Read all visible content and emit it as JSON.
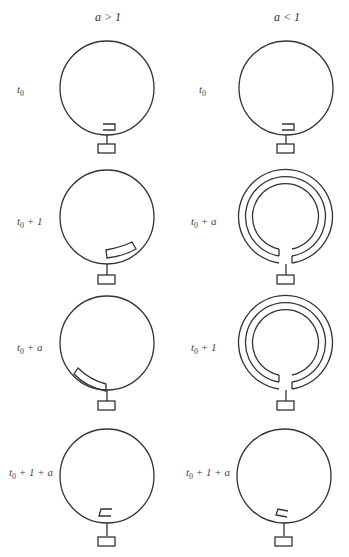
{
  "columns": [
    {
      "header": "a > 1"
    },
    {
      "header": "a < 1"
    }
  ],
  "rows": [
    {
      "left_label": "t0",
      "right_label": "t0"
    },
    {
      "left_label": "t0 + 1",
      "right_label": "t0 + a"
    },
    {
      "left_label": "t0 + a",
      "right_label": "t0 + 1"
    },
    {
      "left_label": "t0 + 1 + a",
      "right_label": "t0 + 1 + a"
    }
  ],
  "labels": {
    "r0l_sub": "0",
    "r0l_rest": "",
    "r1l_sub": "0",
    "r1l_rest": " + 1",
    "r2l_sub": "0",
    "r2l_rest": " + a",
    "r3l_sub": "0",
    "r3l_rest": " + 1 + a",
    "r0r_sub": "0",
    "r0r_rest": "",
    "r1r_sub": "0",
    "r1r_rest": " + a",
    "r2r_sub": "0",
    "r2r_rest": " + 1",
    "r3r_sub": "0",
    "r3r_rest": " + 1 + a",
    "t": "t"
  }
}
